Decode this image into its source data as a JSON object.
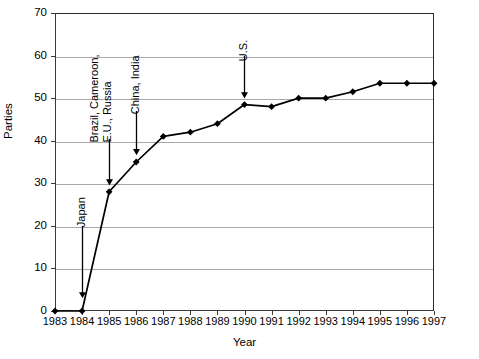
{
  "chart_data": {
    "type": "line",
    "title": "",
    "xlabel": "Year",
    "ylabel": "Parties",
    "xlim": [
      1983,
      1997
    ],
    "ylim": [
      0,
      70
    ],
    "grid": true,
    "legend": "none",
    "x": [
      1983,
      1984,
      1985,
      1986,
      1987,
      1988,
      1989,
      1990,
      1991,
      1992,
      1993,
      1994,
      1995,
      1996,
      1997
    ],
    "xtick_labels": [
      "1983",
      "1984",
      "1985",
      "1986",
      "1987",
      "1988",
      "1989",
      "1990",
      "1991",
      "1992",
      "1993",
      "1994",
      "1995",
      "1996",
      "1997"
    ],
    "ytick_labels": [
      "0",
      "10",
      "20",
      "30",
      "40",
      "50",
      "60",
      "70"
    ],
    "ytick_values": [
      0,
      10,
      20,
      30,
      40,
      50,
      60,
      70
    ],
    "values": [
      0,
      0,
      28,
      35,
      41,
      42,
      44,
      48.5,
      48,
      50,
      50,
      51.5,
      53.5,
      53.5,
      53.5
    ],
    "series": [
      {
        "name": "Parties",
        "values": [
          0,
          0,
          28,
          35,
          41,
          42,
          44,
          48.5,
          48,
          50,
          50,
          51.5,
          53.5,
          53.5,
          53.5
        ],
        "marker": "diamond",
        "color": "#000000"
      }
    ],
    "annotations": [
      {
        "id": "japan",
        "text": "Japan",
        "lines": [
          "Japan"
        ],
        "x": 1984,
        "y": 7,
        "target_y": 0
      },
      {
        "id": "brazil",
        "text": "Brazil, Cameroon, E.U., Russia",
        "lines": [
          "Brazil, Cameroon,",
          "E.U., Russia"
        ],
        "x": 1985,
        "y": 35,
        "target_y": 28
      },
      {
        "id": "china",
        "text": "China, India",
        "lines": [
          "China, India"
        ],
        "x": 1986,
        "y": 42,
        "target_y": 35
      },
      {
        "id": "us",
        "text": "U.S.",
        "lines": [
          "U.S."
        ],
        "x": 1990,
        "y": 55.5,
        "target_y": 48.5
      }
    ]
  },
  "colors": {
    "line": "#000000",
    "marker": "#000000",
    "grid": "#a8a8a8",
    "axis": "#3a3a3a",
    "frame": "#2b2b2b",
    "background": "#ffffff",
    "text": "#000000"
  }
}
